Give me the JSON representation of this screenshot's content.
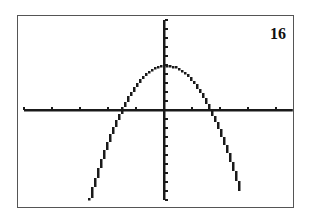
{
  "panel": {
    "label": "16"
  },
  "colors": {
    "axis": "#1a1a1a",
    "curve": "#1a1a1a",
    "frame": "#555555",
    "background": "#ffffff"
  },
  "chart_data": {
    "type": "line",
    "title": "",
    "annotation": "16",
    "xlabel": "",
    "ylabel": "",
    "xlim": [
      -5,
      4.6
    ],
    "ylim": [
      -10,
      10
    ],
    "xscl": 1,
    "yscl": 1,
    "grid": false,
    "legend": null,
    "series": [
      {
        "name": "y = -2x^2 + 5",
        "x": [
          -2.7,
          -2.5,
          -2,
          -1.58,
          -1.5,
          -1,
          -0.5,
          0,
          0.5,
          1,
          1.5,
          1.58,
          2,
          2.5,
          2.7
        ],
        "y": [
          -9.6,
          -7.5,
          -3,
          0,
          0.5,
          3,
          4.5,
          5,
          4.5,
          3,
          0.5,
          0,
          -3,
          -7.5,
          -9.6
        ]
      }
    ],
    "features": {
      "vertex": [
        0,
        5
      ],
      "x_intercepts": [
        -1.58,
        1.58
      ],
      "opens": "down"
    }
  }
}
